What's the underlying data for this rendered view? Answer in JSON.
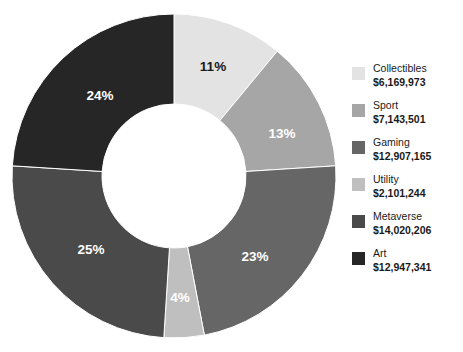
{
  "chart_data": {
    "type": "pie",
    "variant": "donut",
    "title": "",
    "xlabel": "",
    "ylabel": "",
    "legend_position": "right",
    "grid": false,
    "start_angle_deg": 0,
    "direction": "clockwise",
    "center": {
      "x": 174,
      "y": 176
    },
    "outer_radius": 162,
    "inner_radius": 72,
    "categories": [
      "Collectibles",
      "Sport",
      "Gaming",
      "Utility",
      "Metaverse",
      "Art"
    ],
    "values": [
      6169973,
      7143501,
      12907165,
      2101244,
      14020206,
      12947341
    ],
    "value_labels": [
      "$6,169,973",
      "$7,143,501",
      "$12,907,165",
      "$2,101,244",
      "$14,020,206",
      "$12,947,341"
    ],
    "percentages": [
      11,
      13,
      23,
      4,
      25,
      24
    ],
    "percent_labels": [
      "11%",
      "13%",
      "23%",
      "4%",
      "25%",
      "24%"
    ],
    "colors": [
      "#E3E3E3",
      "#A6A6A6",
      "#666666",
      "#BFBFBF",
      "#4A4A4A",
      "#262626"
    ],
    "label_text_colors": [
      "#1a1a1a",
      "#ffffff",
      "#ffffff",
      "#ffffff",
      "#ffffff",
      "#ffffff"
    ],
    "slices": [
      {
        "name": "Collectibles",
        "value": 6169973,
        "value_label": "$6,169,973",
        "percent": 11,
        "percent_label": "11%",
        "color": "#E3E3E3",
        "label_color": "#1a1a1a",
        "start_angle": 0,
        "end_angle": 39.6,
        "label_x": 213,
        "label_y": 67
      },
      {
        "name": "Sport",
        "value": 7143501,
        "value_label": "$7,143,501",
        "percent": 13,
        "percent_label": "13%",
        "color": "#A6A6A6",
        "label_color": "#ffffff",
        "start_angle": 39.6,
        "end_angle": 86.4,
        "label_x": 282,
        "label_y": 134
      },
      {
        "name": "Gaming",
        "value": 12907165,
        "value_label": "$12,907,165",
        "percent": 23,
        "percent_label": "23%",
        "color": "#666666",
        "label_color": "#ffffff",
        "start_angle": 86.4,
        "end_angle": 169.2,
        "label_x": 255,
        "label_y": 257
      },
      {
        "name": "Utility",
        "value": 2101244,
        "value_label": "$2,101,244",
        "percent": 4,
        "percent_label": "4%",
        "color": "#BFBFBF",
        "label_color": "#ffffff",
        "start_angle": 169.2,
        "end_angle": 183.6,
        "label_x": 180,
        "label_y": 298
      },
      {
        "name": "Metaverse",
        "value": 14020206,
        "value_label": "$14,020,206",
        "percent": 25,
        "percent_label": "25%",
        "color": "#4A4A4A",
        "label_color": "#ffffff",
        "start_angle": 183.6,
        "end_angle": 273.6,
        "label_x": 91,
        "label_y": 250
      },
      {
        "name": "Art",
        "value": 12947341,
        "value_label": "$12,947,341",
        "percent": 24,
        "percent_label": "24%",
        "color": "#262626",
        "label_color": "#ffffff",
        "start_angle": 273.6,
        "end_angle": 360,
        "label_x": 100,
        "label_y": 96
      }
    ]
  },
  "legend": {
    "items": [
      {
        "name": "Collectibles",
        "value": "$6,169,973",
        "color": "#E3E3E3"
      },
      {
        "name": "Sport",
        "value": "$7,143,501",
        "color": "#A6A6A6"
      },
      {
        "name": "Gaming",
        "value": "$12,907,165",
        "color": "#666666"
      },
      {
        "name": "Utility",
        "value": "$2,101,244",
        "color": "#BFBFBF"
      },
      {
        "name": "Metaverse",
        "value": "$14,020,206",
        "color": "#4A4A4A"
      },
      {
        "name": "Art",
        "value": "$12,947,341",
        "color": "#262626"
      }
    ]
  }
}
